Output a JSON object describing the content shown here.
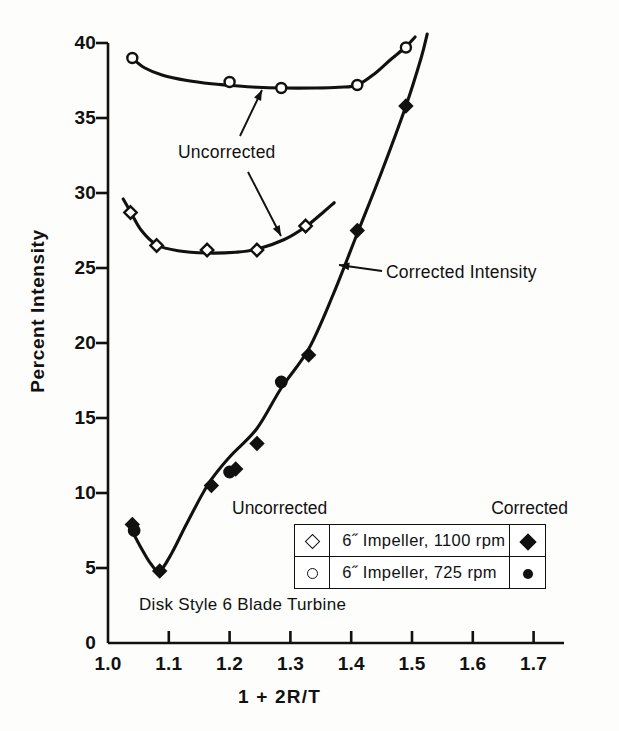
{
  "chart_data": {
    "type": "scatter",
    "title": "",
    "caption": "Disk Style 6 Blade Turbine",
    "xlabel": "1 + 2R/T",
    "ylabel": "Percent Intensity",
    "xlim": [
      1.0,
      1.75
    ],
    "ylim": [
      0,
      40
    ],
    "xticks": [
      "1.0",
      "1.1",
      "1.2",
      "1.3",
      "1.4",
      "1.5",
      "1.6",
      "1.7"
    ],
    "xtick_values": [
      1.0,
      1.1,
      1.2,
      1.3,
      1.4,
      1.5,
      1.6,
      1.7
    ],
    "yticks": [
      "0",
      "5",
      "10",
      "15",
      "20",
      "25",
      "30",
      "35",
      "40"
    ],
    "ytick_values": [
      0,
      5,
      10,
      15,
      20,
      25,
      30,
      35,
      40
    ],
    "grid": false,
    "legend_position": "inside-lower-right",
    "annotations": [
      {
        "text": "Uncorrected",
        "points_to": [
          "upper-open-circle-curve",
          "upper-open-diamond-curve"
        ]
      },
      {
        "text": "Corrected Intensity",
        "points_to": [
          "filled-marker-curve"
        ]
      }
    ],
    "series": [
      {
        "name": "6˝ Impeller, 725 rpm — Uncorrected",
        "marker": "open-circle",
        "x": [
          1.04,
          1.2,
          1.285,
          1.41,
          1.49
        ],
        "y": [
          39.0,
          37.4,
          37.0,
          37.2,
          39.7
        ]
      },
      {
        "name": "6˝ Impeller, 1100 rpm — Uncorrected",
        "marker": "open-diamond",
        "x": [
          1.037,
          1.08,
          1.163,
          1.245,
          1.325
        ],
        "y": [
          28.7,
          26.5,
          26.2,
          26.2,
          27.8
        ]
      },
      {
        "name": "6˝ Impeller, 1100 rpm — Corrected",
        "marker": "filled-diamond",
        "x": [
          1.04,
          1.085,
          1.17,
          1.21,
          1.245,
          1.33,
          1.41,
          1.49
        ],
        "y": [
          7.9,
          4.8,
          10.5,
          11.6,
          13.3,
          19.2,
          27.5,
          35.8
        ]
      },
      {
        "name": "6˝ Impeller, 725 rpm — Corrected",
        "marker": "filled-circle",
        "x": [
          1.043,
          1.2,
          1.285
        ],
        "y": [
          7.5,
          11.4,
          17.4
        ]
      }
    ],
    "curve_uncorrected_725": [
      [
        1.038,
        39.05
      ],
      [
        1.06,
        38.35
      ],
      [
        1.09,
        37.85
      ],
      [
        1.13,
        37.5
      ],
      [
        1.17,
        37.28
      ],
      [
        1.2,
        37.18
      ],
      [
        1.245,
        37.05
      ],
      [
        1.285,
        37.0
      ],
      [
        1.34,
        37.0
      ],
      [
        1.38,
        37.05
      ],
      [
        1.41,
        37.2
      ],
      [
        1.44,
        38.0
      ],
      [
        1.465,
        38.9
      ],
      [
        1.49,
        39.75
      ],
      [
        1.505,
        40.4
      ]
    ],
    "curve_uncorrected_1100": [
      [
        1.025,
        29.6
      ],
      [
        1.037,
        28.75
      ],
      [
        1.055,
        27.5
      ],
      [
        1.08,
        26.55
      ],
      [
        1.115,
        26.15
      ],
      [
        1.163,
        26.0
      ],
      [
        1.21,
        26.05
      ],
      [
        1.245,
        26.25
      ],
      [
        1.29,
        26.9
      ],
      [
        1.325,
        27.75
      ],
      [
        1.355,
        28.75
      ],
      [
        1.372,
        29.35
      ]
    ],
    "curve_corrected": [
      [
        1.038,
        7.6
      ],
      [
        1.055,
        6.3
      ],
      [
        1.07,
        5.3
      ],
      [
        1.085,
        4.8
      ],
      [
        1.105,
        6.0
      ],
      [
        1.13,
        8.0
      ],
      [
        1.165,
        10.6
      ],
      [
        1.2,
        12.4
      ],
      [
        1.245,
        14.3
      ],
      [
        1.285,
        17.0
      ],
      [
        1.33,
        19.6
      ],
      [
        1.37,
        23.2
      ],
      [
        1.41,
        27.3
      ],
      [
        1.45,
        31.4
      ],
      [
        1.49,
        35.8
      ],
      [
        1.515,
        39.0
      ],
      [
        1.525,
        40.6
      ]
    ]
  },
  "legend": {
    "header_uncorrected": "Uncorrected",
    "header_corrected": "Corrected",
    "rows": [
      {
        "uncorrected_marker": "open-diamond-icon",
        "label": "6˝ Impeller, 1100 rpm",
        "corrected_marker": "filled-diamond-icon"
      },
      {
        "uncorrected_marker": "open-circle-icon",
        "label": "6˝ Impeller,  725 rpm",
        "corrected_marker": "filled-circle-icon"
      }
    ]
  },
  "axes": {
    "y_title": "Percent Intensity",
    "x_title": "1 + 2R/T"
  },
  "annotations": {
    "uncorrected": "Uncorrected",
    "corrected_intensity": "Corrected Intensity",
    "turbine_caption": "Disk Style 6 Blade Turbine"
  },
  "colors": {
    "ink": "#111111",
    "background": "#fdfdfb"
  }
}
